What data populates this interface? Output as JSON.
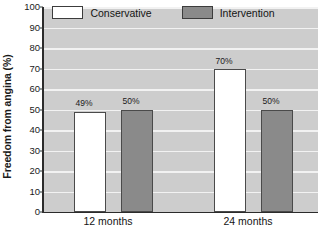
{
  "chart_data": {
    "type": "bar",
    "title": "",
    "xlabel": "",
    "ylabel": "Freedom from angina (%)",
    "ylim": [
      0,
      100
    ],
    "ytick_step": 10,
    "yticks": [
      0,
      10,
      20,
      30,
      40,
      50,
      60,
      70,
      80,
      90,
      100
    ],
    "ytick_labels": [
      "0",
      "10",
      "20",
      "30",
      "40",
      "50",
      "60",
      "70",
      "80",
      "90",
      "100"
    ],
    "categories": [
      "12 months",
      "24 months"
    ],
    "grid": "horizontal",
    "legend_position": "top-center",
    "series": [
      {
        "name": "Conservative",
        "values": [
          49,
          70
        ],
        "data_labels": [
          "49%",
          "50%"
        ],
        "color": "#ffffff"
      },
      {
        "name": "Intervention",
        "values": [
          50,
          50
        ],
        "data_labels": [
          "50%",
          "50%"
        ],
        "color": "#8a8a8a"
      }
    ],
    "bar_labels": [
      {
        "text": "49%",
        "x": 84,
        "y": 99
      },
      {
        "text": "50%",
        "x": 131,
        "y": 97
      },
      {
        "text": "70%",
        "x": 224,
        "y": 57
      },
      {
        "text": "50%",
        "x": 271,
        "y": 97
      }
    ],
    "bars": [
      {
        "series": "Conservative",
        "category": "12 months",
        "value": 49,
        "left": 31,
        "width": 32
      },
      {
        "series": "Intervention",
        "category": "12 months",
        "value": 50,
        "left": 78,
        "width": 32
      },
      {
        "series": "Conservative",
        "category": "24 months",
        "value": 70,
        "left": 171,
        "width": 32
      },
      {
        "series": "Intervention",
        "category": "24 months",
        "value": 50,
        "left": 218,
        "width": 32
      }
    ],
    "colors": {
      "plot_background": "#cdcdcd",
      "gridline": "#f2f2f2",
      "axis": "#2b2b2b",
      "bar_border": "#4a4a4a",
      "conservative": "#ffffff",
      "intervention": "#8a8a8a",
      "text": "#141414",
      "page_background": "#ffffff"
    }
  },
  "legend": {
    "items": [
      {
        "label": "Conservative",
        "swatch": "conservative"
      },
      {
        "label": "Intervention",
        "swatch": "intervention"
      }
    ]
  },
  "axis": {
    "y_title": "Freedom from angina (%)",
    "x_categories": [
      {
        "label": "12 months",
        "x": 108
      },
      {
        "label": "24 months",
        "x": 248
      }
    ]
  }
}
